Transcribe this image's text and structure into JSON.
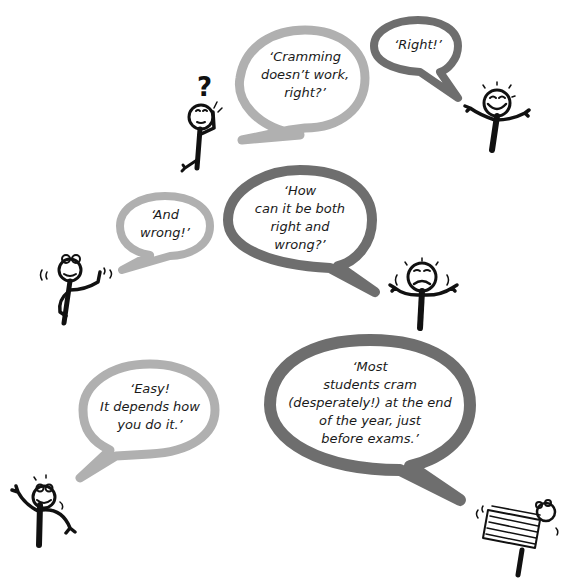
{
  "colors": {
    "light_bubble": "#b0b0b0",
    "dark_bubble": "#6e6e6e",
    "ink": "#111111",
    "background": "#ffffff"
  },
  "bubbles": [
    {
      "id": "cramming",
      "text": "‘Cramming\ndoesn’t work,\nright?’",
      "tone": "light"
    },
    {
      "id": "right",
      "text": "‘Right!’",
      "tone": "dark"
    },
    {
      "id": "and-wrong",
      "text": "‘And\nwrong!’",
      "tone": "light"
    },
    {
      "id": "how-both",
      "text": "‘How\ncan it be both\nright and\nwrong?’",
      "tone": "dark"
    },
    {
      "id": "easy",
      "text": "‘Easy!\nIt depends how\nyou do it.’",
      "tone": "light"
    },
    {
      "id": "most-students",
      "text": "‘Most\nstudents cram\n(desperately!) at the end\nof the year, just\nbefore exams.’",
      "tone": "dark"
    }
  ],
  "figures": [
    {
      "id": "questioning",
      "label": "questioning figure with question mark",
      "question_mark": "?"
    },
    {
      "id": "cheerful",
      "label": "cheerful figure arms out"
    },
    {
      "id": "pointing",
      "label": "figure pointing up"
    },
    {
      "id": "worried",
      "label": "worried figure shrugging"
    },
    {
      "id": "waving",
      "label": "waving figure"
    },
    {
      "id": "book-carrier",
      "label": "figure carrying stack of books"
    }
  ]
}
